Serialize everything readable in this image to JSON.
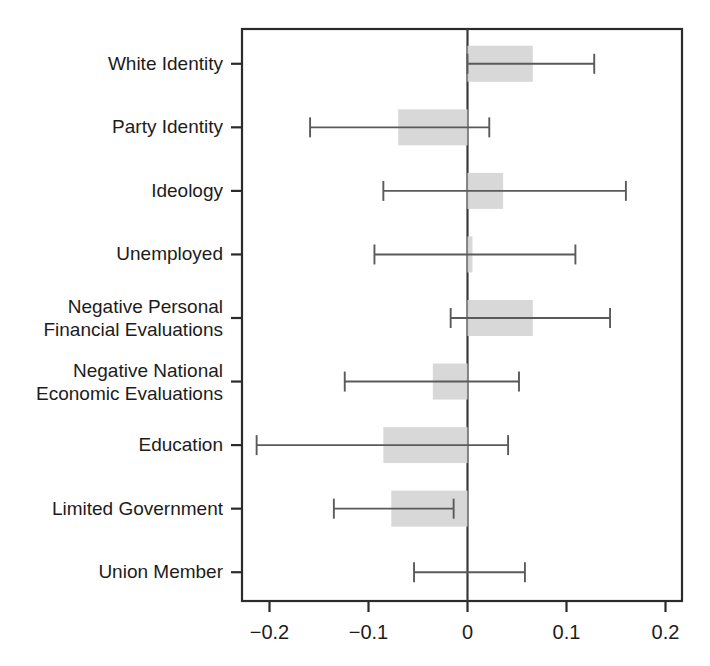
{
  "figure": {
    "title": "",
    "background_color": "#ffffff",
    "frame_color": "#2b2b2b",
    "box_fill_color": "#d6d6d6",
    "ci_line_color": "#5a5a5a",
    "zero_line_color": "#3a3a3a"
  },
  "chart_data": {
    "type": "bar",
    "plot_style": "horizontal-coefficient-plot",
    "title": "",
    "xlabel": "",
    "ylabel": "",
    "xlim": [
      -0.2445,
      0.2172
    ],
    "ylim": [
      0,
      10
    ],
    "grid": false,
    "legend": null,
    "zero_reference_line": 0,
    "xticks": [
      -0.2,
      -0.1,
      0,
      0.1,
      0.2
    ],
    "xtick_labels": [
      "−0.2",
      "−0.1",
      "0",
      "0.1",
      "0.2"
    ],
    "categories": [
      "White Identity",
      "Party Identity",
      "Ideology",
      "Unemployed",
      "Negative Personal Financial Evaluations",
      "Negative National Economic Evaluations",
      "Education",
      "Limited Government",
      "Union Member"
    ],
    "category_label_lines": [
      [
        "White Identity"
      ],
      [
        "Party Identity"
      ],
      [
        "Ideology"
      ],
      [
        "Unemployed"
      ],
      [
        "Negative Personal",
        "Financial Evaluations"
      ],
      [
        "Negative National",
        "Economic Evaluations"
      ],
      [
        "Education"
      ],
      [
        "Limited Government"
      ],
      [
        "Union Member"
      ]
    ],
    "values": [
      0.066,
      -0.07,
      0.036,
      0.005,
      0.066,
      -0.035,
      -0.085,
      -0.077,
      0.0
    ],
    "series": [
      {
        "name": "Coefficient estimate (shaded bar from zero)",
        "values": [
          0.066,
          -0.07,
          0.036,
          0.005,
          0.066,
          -0.035,
          -0.085,
          -0.077,
          0.0
        ]
      }
    ],
    "ci_lower": [
      0.0,
      -0.159,
      -0.085,
      -0.094,
      -0.017,
      -0.124,
      -0.213,
      -0.135,
      -0.054
    ],
    "ci_upper": [
      0.128,
      0.022,
      0.16,
      0.109,
      0.144,
      0.052,
      0.041,
      -0.014,
      0.058
    ],
    "points": [
      {
        "label": "White Identity",
        "estimate": 0.066,
        "ci_lower": 0.0,
        "ci_upper": 0.128
      },
      {
        "label": "Party Identity",
        "estimate": -0.07,
        "ci_lower": -0.159,
        "ci_upper": 0.022
      },
      {
        "label": "Ideology",
        "estimate": 0.036,
        "ci_lower": -0.085,
        "ci_upper": 0.16
      },
      {
        "label": "Unemployed",
        "estimate": 0.005,
        "ci_lower": -0.094,
        "ci_upper": 0.109
      },
      {
        "label": "Negative Personal Financial Evaluations",
        "estimate": 0.066,
        "ci_lower": -0.017,
        "ci_upper": 0.144
      },
      {
        "label": "Negative National Economic Evaluations",
        "estimate": -0.035,
        "ci_lower": -0.124,
        "ci_upper": 0.052
      },
      {
        "label": "Education",
        "estimate": -0.085,
        "ci_lower": -0.213,
        "ci_upper": 0.041
      },
      {
        "label": "Limited Government",
        "estimate": -0.077,
        "ci_lower": -0.135,
        "ci_upper": -0.014
      },
      {
        "label": "Union Member",
        "estimate": 0.0,
        "ci_lower": -0.054,
        "ci_upper": 0.058
      }
    ]
  }
}
